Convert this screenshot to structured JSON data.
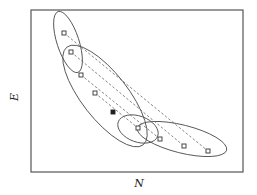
{
  "diagram": {
    "x_axis_label": "N",
    "y_axis_label": "E",
    "marker_legend": {
      "open_square": "state",
      "filled_square": "central point"
    },
    "points": [
      {
        "id": "p1",
        "marker": "open"
      },
      {
        "id": "p2",
        "marker": "open"
      },
      {
        "id": "p3",
        "marker": "open"
      },
      {
        "id": "p4",
        "marker": "open"
      },
      {
        "id": "c",
        "marker": "filled"
      },
      {
        "id": "p5",
        "marker": "open"
      },
      {
        "id": "p6",
        "marker": "open"
      },
      {
        "id": "p7",
        "marker": "open"
      },
      {
        "id": "p8",
        "marker": "open"
      }
    ],
    "connections": [
      {
        "from": "p1",
        "to": "p8",
        "style": "dashed"
      },
      {
        "from": "p2",
        "to": "p7",
        "style": "dashed"
      },
      {
        "from": "p3",
        "to": "p6",
        "style": "dashed"
      },
      {
        "from": "p4",
        "to": "p5",
        "style": "dashed"
      }
    ],
    "ellipse_count": 4,
    "colors": {
      "stroke": "#555555",
      "point_fill_open": "#ffffff",
      "point_fill_filled": "#222222"
    }
  }
}
